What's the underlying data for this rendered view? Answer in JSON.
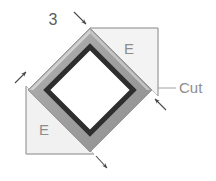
{
  "figure": {
    "type": "engineering-diagram",
    "background_color": "#ffffff",
    "labels": {
      "thickness": "3",
      "edge_right": "E",
      "edge_left": "E",
      "cut": "Cut"
    },
    "colors": {
      "tube_outer_band": "#a3a3a3",
      "tube_inner_edge": "#2f2f2f",
      "tube_highlight": "#c9c9c9",
      "triangle_fill": "#f2f2f2",
      "triangle_stroke": "#b5b5b5",
      "leader_line": "#9a9a9a",
      "arrow": "#4a4a4a",
      "label_text": "#8d8d8d",
      "number_text": "#5c5c5c"
    },
    "geometry": {
      "diamond_vertices": [
        {
          "name": "top",
          "x": 90,
          "y": 28
        },
        {
          "name": "right",
          "x": 152,
          "y": 90
        },
        {
          "name": "bottom",
          "x": 90,
          "y": 152
        },
        {
          "name": "left",
          "x": 28,
          "y": 90
        }
      ],
      "band_width": 13,
      "upper_right_triangle": [
        {
          "x": 90,
          "y": 28
        },
        {
          "x": 158,
          "y": 28
        },
        {
          "x": 158,
          "y": 96
        }
      ],
      "lower_left_triangle": [
        {
          "x": 26,
          "y": 86
        },
        {
          "x": 26,
          "y": 154
        },
        {
          "x": 94,
          "y": 154
        }
      ]
    },
    "annotations": [
      {
        "name": "thickness-dimension",
        "label": "3",
        "points_to": "tube wall thickness at top vertex"
      },
      {
        "name": "edge-dimension-right",
        "label": "E",
        "points_to": "upper right edge length"
      },
      {
        "name": "edge-dimension-left",
        "label": "E",
        "points_to": "lower left edge length"
      },
      {
        "name": "cut-callout",
        "label": "Cut",
        "points_to": "right vertex miter cut"
      }
    ]
  }
}
